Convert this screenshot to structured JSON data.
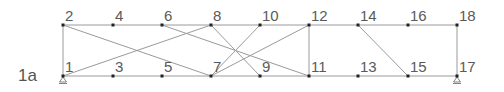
{
  "figure": {
    "label": "1a",
    "colors": {
      "member": "#9a9a9a",
      "node": "#222222",
      "label": "#5a5a5a"
    }
  },
  "nodes": [
    {
      "id": "1",
      "x": 63,
      "y": 76
    },
    {
      "id": "2",
      "x": 63,
      "y": 25
    },
    {
      "id": "3",
      "x": 113,
      "y": 76
    },
    {
      "id": "4",
      "x": 113,
      "y": 25
    },
    {
      "id": "5",
      "x": 162,
      "y": 76
    },
    {
      "id": "6",
      "x": 162,
      "y": 25
    },
    {
      "id": "7",
      "x": 211,
      "y": 76
    },
    {
      "id": "8",
      "x": 211,
      "y": 25
    },
    {
      "id": "9",
      "x": 260,
      "y": 76
    },
    {
      "id": "10",
      "x": 260,
      "y": 25
    },
    {
      "id": "11",
      "x": 309,
      "y": 76
    },
    {
      "id": "12",
      "x": 309,
      "y": 25
    },
    {
      "id": "13",
      "x": 358,
      "y": 76
    },
    {
      "id": "14",
      "x": 358,
      "y": 25
    },
    {
      "id": "15",
      "x": 408,
      "y": 76
    },
    {
      "id": "16",
      "x": 408,
      "y": 25
    },
    {
      "id": "17",
      "x": 457,
      "y": 76
    },
    {
      "id": "18",
      "x": 457,
      "y": 25
    }
  ],
  "members": [
    [
      "1",
      "17"
    ],
    [
      "2",
      "18"
    ],
    [
      "1",
      "2"
    ],
    [
      "11",
      "12"
    ],
    [
      "17",
      "18"
    ],
    [
      "1",
      "8"
    ],
    [
      "2",
      "7"
    ],
    [
      "6",
      "11"
    ],
    [
      "8",
      "9"
    ],
    [
      "7",
      "10"
    ],
    [
      "7",
      "12"
    ],
    [
      "14",
      "15"
    ]
  ],
  "supports": [
    "1",
    "17"
  ]
}
